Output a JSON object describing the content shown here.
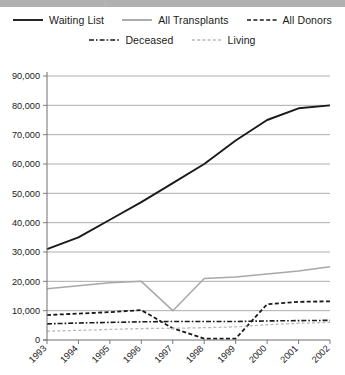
{
  "topbar": {
    "segments": [
      {
        "x": 0,
        "width": 104
      },
      {
        "x": 107,
        "width": 238
      }
    ]
  },
  "chart_data": {
    "type": "line",
    "title": "",
    "subtitle": "",
    "xlabel": "",
    "ylabel": "",
    "grid": true,
    "legend_position": "top",
    "x": [
      1993,
      1994,
      1995,
      1996,
      1997,
      1998,
      1999,
      2000,
      2001,
      2002
    ],
    "categories": [
      "1993",
      "1994",
      "1995",
      "1996",
      "1997",
      "1998",
      "1999",
      "2000",
      "2001",
      "2002"
    ],
    "xlim": [
      1993,
      2002
    ],
    "ylim": [
      0,
      90000
    ],
    "ytick_labels": [
      "0",
      "10,000",
      "20,000",
      "30,000",
      "40,000",
      "50,000",
      "60,000",
      "70,000",
      "80,000",
      "90,000"
    ],
    "ytick_values": [
      0,
      10000,
      20000,
      30000,
      40000,
      50000,
      60000,
      70000,
      80000,
      90000
    ],
    "series": [
      {
        "name": "Waiting List",
        "style": "solid",
        "color": "#1a1a1a",
        "width": 1.9,
        "values": [
          31000,
          35000,
          41000,
          47000,
          53500,
          60000,
          68000,
          75000,
          79000,
          80000
        ]
      },
      {
        "name": "All Transplants",
        "style": "solid",
        "color": "#a8a8a8",
        "width": 1.5,
        "values": [
          17500,
          18500,
          19500,
          20000,
          10000,
          21000,
          21500,
          22500,
          23500,
          25000
        ]
      },
      {
        "name": "All Donors",
        "style": "dashed",
        "color": "#1a1a1a",
        "width": 1.8,
        "values": [
          8500,
          9000,
          9500,
          10200,
          4000,
          500,
          500,
          12200,
          13000,
          13200
        ]
      },
      {
        "name": "Deceased",
        "style": "dashdot",
        "color": "#1a1a1a",
        "width": 1.6,
        "values": [
          5500,
          5800,
          6000,
          6200,
          6300,
          6300,
          6300,
          6500,
          6600,
          6700
        ]
      },
      {
        "name": "Living",
        "style": "dashed-light",
        "color": "#b8b8b8",
        "width": 1.3,
        "values": [
          3000,
          3300,
          3600,
          3900,
          4000,
          4200,
          4500,
          5200,
          5700,
          6000
        ]
      }
    ],
    "annotations": [
      {
        "text": "All Transplants dips sharply near 1996–1997",
        "visible": false
      },
      {
        "text": "All Donors falls to near zero in 1998",
        "visible": false
      }
    ]
  },
  "legend": {
    "rows": [
      [
        {
          "label": "Waiting List",
          "icon": "solid-line-icon",
          "style": "solid",
          "color": "#1a1a1a"
        },
        {
          "label": "All Transplants",
          "icon": "solid-line-icon",
          "style": "solid",
          "color": "#a8a8a8"
        },
        {
          "label": "All Donors",
          "icon": "dashed-line-icon",
          "style": "dashed",
          "color": "#1a1a1a"
        }
      ],
      [
        {
          "label": "Deceased",
          "icon": "dash-dot-line-icon",
          "style": "dashdot",
          "color": "#1a1a1a"
        },
        {
          "label": "Living",
          "icon": "dashed-line-icon",
          "style": "dashed-light",
          "color": "#b8b8b8"
        }
      ]
    ]
  },
  "axis_colors": {
    "grid": "#8a8a8a",
    "axis": "#6e6e6e",
    "text": "#1a1a1a"
  }
}
